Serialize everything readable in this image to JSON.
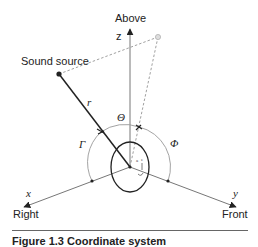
{
  "figure": {
    "labels": {
      "above": "Above",
      "z_axis": "z",
      "sound_source": "Sound source",
      "r": "r",
      "theta": "Θ",
      "phi": "Φ",
      "gamma": "Γ",
      "x_axis": "x",
      "right": "Right",
      "y_axis": "y",
      "front": "Front"
    },
    "caption": "Figure 1.3   Coordinate system",
    "colors": {
      "axis": "#555555",
      "source_line": "#222222",
      "dashed": "#888888",
      "arc": "#999999",
      "projection_dot": "#cccccc"
    }
  }
}
